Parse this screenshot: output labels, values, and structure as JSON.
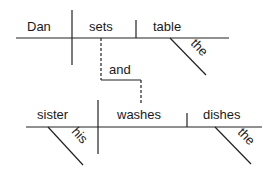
{
  "diagram": {
    "type": "sentence-diagram",
    "clause1": {
      "subject": "Dan",
      "verb": "sets",
      "object": "table",
      "object_modifier": "the"
    },
    "conjunction": "and",
    "clause2": {
      "subject": "sister",
      "subject_modifier": "his",
      "verb": "washes",
      "object": "dishes",
      "object_modifier": "the"
    }
  }
}
